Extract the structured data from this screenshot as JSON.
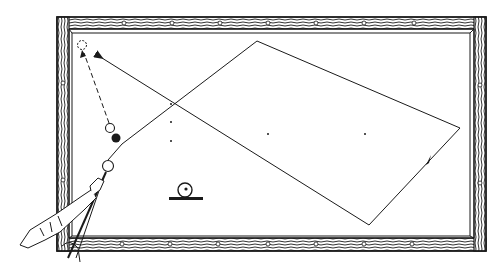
{
  "diagram": {
    "type": "billiards-shot-diagram",
    "colors": {
      "ink": "#1a1a1a",
      "cloth": "#ffffff",
      "background": "#ffffff"
    },
    "table": {
      "outer": {
        "x": 57,
        "y": 17,
        "w": 429,
        "h": 234
      },
      "inner": {
        "x": 72,
        "y": 33,
        "w": 398,
        "h": 203
      },
      "diamonds_top": [
        75,
        125,
        172,
        222,
        268,
        318,
        365,
        415
      ],
      "diamonds_bottom": [
        122,
        170,
        218,
        268,
        316,
        364,
        412
      ],
      "diamonds_left": [
        62,
        126,
        178
      ],
      "diamonds_right": [
        84,
        136,
        183
      ]
    },
    "balls": {
      "object_ball": {
        "cx": 110,
        "cy": 128,
        "r": 5,
        "label": "object ball"
      },
      "black_ball": {
        "cx": 116,
        "cy": 137,
        "r": 5,
        "label": "black ball"
      },
      "cue_ball": {
        "cx": 108,
        "cy": 166,
        "r": 6,
        "label": "cue ball"
      },
      "ghost_ball": {
        "cx": 82,
        "cy": 45,
        "r": 5,
        "label": "target position"
      }
    },
    "cue_ball_path": [
      [
        108,
        160
      ],
      [
        122,
        144
      ],
      [
        257,
        41
      ],
      [
        460,
        128
      ],
      [
        369,
        225
      ],
      [
        102,
        58
      ]
    ],
    "object_ball_path": [
      [
        109,
        123
      ],
      [
        83,
        52
      ]
    ],
    "table_spots": [
      [
        171,
        104
      ],
      [
        171,
        122
      ],
      [
        171,
        141
      ],
      [
        268,
        122
      ],
      [
        365,
        122
      ]
    ],
    "english_icon": {
      "cx": 185,
      "cy": 190,
      "r": 7,
      "label": "cue tip contact point (center ball)"
    }
  }
}
